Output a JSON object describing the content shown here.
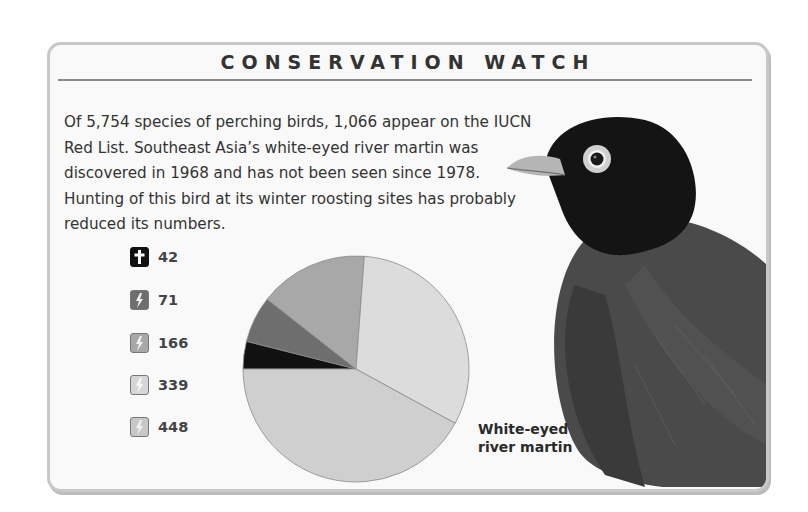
{
  "header": {
    "title": "CONSERVATION WATCH"
  },
  "intro": {
    "text": "Of 5,754 species of perching birds, 1,066 appear on the IUCN Red List. Southeast Asia’s white-eyed river martin was discovered in 1968 and has not been seen since 1978. Hunting of this bird at its winter roosting sites has probably reduced its numbers."
  },
  "legend": [
    {
      "label": "Ex",
      "icon": "cross-icon",
      "count": "42",
      "color": "#111111"
    },
    {
      "label": "Cr",
      "icon": "lightning-icon",
      "count": "71",
      "color": "#6e6e6e"
    },
    {
      "label": "En",
      "icon": "lightning-icon",
      "count": "166",
      "color": "#a8a8a8"
    },
    {
      "label": "Vu",
      "icon": "lightning-icon",
      "count": "339",
      "color": "#dcdcdc"
    },
    {
      "label": "Other",
      "icon": "lightning-icon",
      "count": "448",
      "color": "#cfcfcf"
    }
  ],
  "caption": {
    "line1": "White-eyed",
    "line2": "river martin"
  },
  "chart_data": {
    "type": "pie",
    "categories": [
      "Ex",
      "Cr",
      "En",
      "Vu",
      "Other"
    ],
    "values": [
      42,
      71,
      166,
      339,
      448
    ],
    "total": 1066,
    "colors": [
      "#111111",
      "#6e6e6e",
      "#a8a8a8",
      "#dcdcdc",
      "#cfcfcf"
    ],
    "legend_position": "left"
  }
}
